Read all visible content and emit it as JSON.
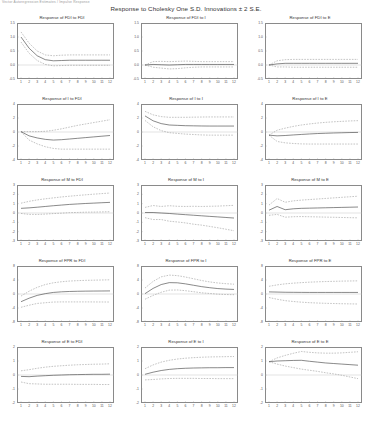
{
  "corner_note": "Vector Autoregression Estimates / Impulse Response",
  "main_title": "Response to Cholesky One S.D. Innovations ± 2 S.E.",
  "chart_data": {
    "type": "line",
    "title": "Response to Cholesky One S.D. Innovations ± 2 S.E.",
    "xlabel": "",
    "ylabel": "",
    "x": [
      1,
      2,
      3,
      4,
      5,
      6,
      7,
      8,
      9,
      10,
      11,
      12
    ],
    "grid": false,
    "legend": "none",
    "band_label": "± 2 S.E.",
    "response_variables": [
      "FDI",
      "I",
      "M",
      "FPR",
      "E"
    ],
    "shock_variables": [
      "FDI",
      "I",
      "E"
    ],
    "panels": [
      {
        "title": "Response of FDI to FDI",
        "response": "FDI",
        "shock": "FDI",
        "ylim": [
          -0.5,
          1.5
        ],
        "yticks": [
          "1.5",
          "1.0",
          "0.5",
          "0.0",
          "-0.5"
        ],
        "xticks": [
          "1",
          "2",
          "3",
          "4",
          "5",
          "6",
          "7",
          "8",
          "9",
          "10",
          "11",
          "12"
        ],
        "mean": [
          1.0,
          0.6,
          0.33,
          0.19,
          0.15,
          0.16,
          0.17,
          0.17,
          0.17,
          0.17,
          0.17,
          0.17
        ],
        "upper": [
          1.18,
          0.78,
          0.5,
          0.36,
          0.33,
          0.35,
          0.36,
          0.36,
          0.36,
          0.36,
          0.36,
          0.36
        ],
        "lower": [
          0.82,
          0.42,
          0.16,
          0.02,
          -0.03,
          -0.02,
          -0.01,
          -0.01,
          -0.01,
          -0.01,
          -0.01,
          -0.01
        ]
      },
      {
        "title": "Response of FDI to I",
        "response": "FDI",
        "shock": "I",
        "ylim": [
          -0.5,
          1.5
        ],
        "yticks": [
          "1.5",
          "1.0",
          "0.5",
          "0.0",
          "-0.5"
        ],
        "xticks": [
          "1",
          "2",
          "3",
          "4",
          "5",
          "6",
          "7",
          "8",
          "9",
          "10",
          "11",
          "12"
        ],
        "mean": [
          0.0,
          0.02,
          0.01,
          0.0,
          0.01,
          0.02,
          0.02,
          0.02,
          0.02,
          0.02,
          0.02,
          0.02
        ],
        "upper": [
          0.0,
          0.12,
          0.13,
          0.12,
          0.13,
          0.14,
          0.13,
          0.12,
          0.12,
          0.12,
          0.12,
          0.12
        ],
        "lower": [
          0.0,
          -0.08,
          -0.11,
          -0.14,
          -0.13,
          -0.1,
          -0.08,
          -0.07,
          -0.07,
          -0.07,
          -0.07,
          -0.07
        ]
      },
      {
        "title": "Response of FDI to E",
        "response": "FDI",
        "shock": "E",
        "ylim": [
          -0.5,
          1.5
        ],
        "yticks": [
          "1.5",
          "1.0",
          "0.5",
          "0.0",
          "-0.5"
        ],
        "xticks": [
          "1",
          "2",
          "3",
          "4",
          "5",
          "6",
          "7",
          "8",
          "9",
          "10",
          "11",
          "12"
        ],
        "mean": [
          0.0,
          0.04,
          0.06,
          0.06,
          0.06,
          0.06,
          0.06,
          0.06,
          0.06,
          0.06,
          0.06,
          0.06
        ],
        "upper": [
          0.0,
          0.15,
          0.19,
          0.2,
          0.2,
          0.2,
          0.2,
          0.2,
          0.2,
          0.2,
          0.2,
          0.2
        ],
        "lower": [
          0.0,
          -0.07,
          -0.07,
          -0.08,
          -0.08,
          -0.08,
          -0.08,
          -0.08,
          -0.08,
          -0.08,
          -0.08,
          -0.08
        ]
      },
      {
        "title": "Response of I to FDI",
        "response": "I",
        "shock": "FDI",
        "ylim": [
          -4,
          4
        ],
        "yticks": [
          "4",
          "2",
          "0",
          "-2",
          "-4"
        ],
        "xticks": [
          "1",
          "2",
          "3",
          "4",
          "5",
          "6",
          "7",
          "8",
          "9",
          "10",
          "11",
          "12"
        ],
        "mean": [
          0.05,
          -0.55,
          -0.85,
          -1.05,
          -1.15,
          -1.1,
          -1.0,
          -0.9,
          -0.8,
          -0.7,
          -0.6,
          -0.5
        ],
        "upper": [
          0.05,
          0.05,
          0.05,
          0.1,
          0.25,
          0.45,
          0.7,
          0.95,
          1.15,
          1.35,
          1.55,
          1.75
        ],
        "lower": [
          0.05,
          -1.15,
          -1.7,
          -2.1,
          -2.35,
          -2.45,
          -2.45,
          -2.45,
          -2.45,
          -2.45,
          -2.45,
          -2.45
        ]
      },
      {
        "title": "Response of I to I",
        "response": "I",
        "shock": "I",
        "ylim": [
          -4,
          4
        ],
        "yticks": [
          "4",
          "2",
          "0",
          "-2",
          "-4"
        ],
        "xticks": [
          "1",
          "2",
          "3",
          "4",
          "5",
          "6",
          "7",
          "8",
          "9",
          "10",
          "11",
          "12"
        ],
        "mean": [
          2.3,
          1.6,
          1.2,
          1.0,
          0.95,
          0.9,
          0.88,
          0.86,
          0.85,
          0.85,
          0.85,
          0.85
        ],
        "upper": [
          2.95,
          2.45,
          2.2,
          2.1,
          2.1,
          2.1,
          2.12,
          2.14,
          2.15,
          2.15,
          2.15,
          2.15
        ],
        "lower": [
          1.65,
          0.75,
          0.2,
          -0.1,
          -0.2,
          -0.3,
          -0.36,
          -0.42,
          -0.45,
          -0.45,
          -0.45,
          -0.45
        ]
      },
      {
        "title": "Response of I to E",
        "response": "I",
        "shock": "E",
        "ylim": [
          -4,
          4
        ],
        "yticks": [
          "4",
          "2",
          "0",
          "-2",
          "-4"
        ],
        "xticks": [
          "1",
          "2",
          "3",
          "4",
          "5",
          "6",
          "7",
          "8",
          "9",
          "10",
          "11",
          "12"
        ],
        "mean": [
          -0.45,
          -0.55,
          -0.5,
          -0.42,
          -0.35,
          -0.28,
          -0.22,
          -0.18,
          -0.14,
          -0.11,
          -0.08,
          -0.06
        ],
        "upper": [
          -0.45,
          0.25,
          0.55,
          0.8,
          1.0,
          1.15,
          1.28,
          1.38,
          1.46,
          1.52,
          1.58,
          1.62
        ],
        "lower": [
          -0.45,
          -1.35,
          -1.55,
          -1.64,
          -1.7,
          -1.72,
          -1.72,
          -1.72,
          -1.72,
          -1.72,
          -1.72,
          -1.72
        ]
      },
      {
        "title": "Response of M to FDI",
        "response": "M",
        "shock": "FDI",
        "ylim": [
          -3,
          3
        ],
        "yticks": [
          "3",
          "2",
          "1",
          "0",
          "-1",
          "-2",
          "-3"
        ],
        "xticks": [
          "1",
          "2",
          "3",
          "4",
          "5",
          "6",
          "7",
          "8",
          "9",
          "10",
          "11",
          "12"
        ],
        "mean": [
          0.5,
          0.55,
          0.62,
          0.7,
          0.78,
          0.85,
          0.92,
          0.97,
          1.02,
          1.06,
          1.1,
          1.14
        ],
        "upper": [
          1.05,
          1.25,
          1.4,
          1.52,
          1.62,
          1.72,
          1.8,
          1.88,
          1.95,
          2.02,
          2.08,
          2.14
        ],
        "lower": [
          -0.05,
          -0.15,
          -0.16,
          -0.12,
          -0.06,
          -0.02,
          0.04,
          0.06,
          0.09,
          0.1,
          0.12,
          0.14
        ]
      },
      {
        "title": "Response of M to I",
        "response": "M",
        "shock": "I",
        "ylim": [
          -3,
          3
        ],
        "yticks": [
          "3",
          "2",
          "1",
          "0",
          "-1",
          "-2",
          "-3"
        ],
        "xticks": [
          "1",
          "2",
          "3",
          "4",
          "5",
          "6",
          "7",
          "8",
          "9",
          "10",
          "11",
          "12"
        ],
        "mean": [
          0.05,
          0.05,
          0.0,
          -0.05,
          -0.12,
          -0.18,
          -0.24,
          -0.3,
          -0.36,
          -0.42,
          -0.48,
          -0.54
        ],
        "upper": [
          0.6,
          0.8,
          0.7,
          0.78,
          0.72,
          0.7,
          0.72,
          0.7,
          0.72,
          0.74,
          0.78,
          0.82
        ],
        "lower": [
          -0.5,
          -0.7,
          -0.7,
          -0.88,
          -0.96,
          -1.06,
          -1.2,
          -1.3,
          -1.44,
          -1.58,
          -1.74,
          -1.9
        ]
      },
      {
        "title": "Response of M to E",
        "response": "M",
        "shock": "E",
        "ylim": [
          -3,
          3
        ],
        "yticks": [
          "3",
          "2",
          "1",
          "0",
          "-1",
          "-2",
          "-3"
        ],
        "xticks": [
          "1",
          "2",
          "3",
          "4",
          "5",
          "6",
          "7",
          "8",
          "9",
          "10",
          "11",
          "12"
        ],
        "mean": [
          0.3,
          0.7,
          0.35,
          0.45,
          0.5,
          0.52,
          0.54,
          0.56,
          0.58,
          0.6,
          0.62,
          0.64
        ],
        "upper": [
          0.85,
          1.55,
          1.15,
          1.3,
          1.38,
          1.44,
          1.5,
          1.56,
          1.62,
          1.68,
          1.74,
          1.8
        ],
        "lower": [
          -0.25,
          -0.15,
          -0.45,
          -0.4,
          -0.38,
          -0.4,
          -0.42,
          -0.44,
          -0.46,
          -0.48,
          -0.5,
          -0.52
        ]
      },
      {
        "title": "Response of FPR to FDI",
        "response": "FPR",
        "shock": "FDI",
        "ylim": [
          -8,
          8
        ],
        "yticks": [
          "8",
          "4",
          "0",
          "-4",
          "-8"
        ],
        "xticks": [
          "1",
          "2",
          "3",
          "4",
          "5",
          "6",
          "7",
          "8",
          "9",
          "10",
          "11",
          "12"
        ],
        "mean": [
          -2.2,
          -1.2,
          -0.4,
          0.1,
          0.45,
          0.62,
          0.72,
          0.78,
          0.82,
          0.84,
          0.86,
          0.88
        ],
        "upper": [
          -0.6,
          0.8,
          1.9,
          2.7,
          3.2,
          3.5,
          3.7,
          3.82,
          3.9,
          3.95,
          4.0,
          4.05
        ],
        "lower": [
          -3.8,
          -3.2,
          -2.7,
          -2.5,
          -2.3,
          -2.26,
          -2.26,
          -2.26,
          -2.26,
          -2.27,
          -2.28,
          -2.29
        ]
      },
      {
        "title": "Response of FPR to I",
        "response": "FPR",
        "shock": "I",
        "ylim": [
          -8,
          8
        ],
        "yticks": [
          "8",
          "4",
          "0",
          "-4",
          "-8"
        ],
        "xticks": [
          "1",
          "2",
          "3",
          "4",
          "5",
          "6",
          "7",
          "8",
          "9",
          "10",
          "11",
          "12"
        ],
        "mean": [
          0.1,
          1.6,
          2.7,
          3.25,
          3.2,
          2.9,
          2.5,
          2.1,
          1.8,
          1.55,
          1.4,
          1.3
        ],
        "upper": [
          1.7,
          3.6,
          4.9,
          5.4,
          5.25,
          4.85,
          4.35,
          3.85,
          3.45,
          3.15,
          2.95,
          2.8
        ],
        "lower": [
          -1.5,
          -0.4,
          0.5,
          1.1,
          1.15,
          0.95,
          0.65,
          0.35,
          0.15,
          -0.05,
          -0.15,
          -0.2
        ]
      },
      {
        "title": "Response of FPR to E",
        "response": "FPR",
        "shock": "E",
        "ylim": [
          -8,
          8
        ],
        "yticks": [
          "8",
          "4",
          "0",
          "-4",
          "-8"
        ],
        "xticks": [
          "1",
          "2",
          "3",
          "4",
          "5",
          "6",
          "7",
          "8",
          "9",
          "10",
          "11",
          "12"
        ],
        "mean": [
          0.6,
          0.55,
          0.5,
          0.48,
          0.46,
          0.45,
          0.45,
          0.45,
          0.45,
          0.45,
          0.45,
          0.45
        ],
        "upper": [
          2.2,
          2.6,
          2.9,
          3.1,
          3.25,
          3.38,
          3.48,
          3.56,
          3.62,
          3.68,
          3.72,
          3.76
        ],
        "lower": [
          -1.0,
          -1.5,
          -1.9,
          -2.14,
          -2.33,
          -2.48,
          -2.58,
          -2.66,
          -2.72,
          -2.78,
          -2.82,
          -2.86
        ]
      },
      {
        "title": "Response of E to FDI",
        "response": "E",
        "shock": "FDI",
        "ylim": [
          -2,
          2
        ],
        "yticks": [
          "2",
          "1",
          "0",
          "-1",
          "-2"
        ],
        "xticks": [
          "1",
          "2",
          "3",
          "4",
          "5",
          "6",
          "7",
          "8",
          "9",
          "10",
          "11",
          "12"
        ],
        "mean": [
          -0.1,
          -0.12,
          -0.08,
          -0.05,
          -0.02,
          0.0,
          0.02,
          0.03,
          0.04,
          0.05,
          0.05,
          0.06
        ],
        "upper": [
          0.3,
          0.38,
          0.48,
          0.56,
          0.62,
          0.66,
          0.7,
          0.73,
          0.75,
          0.77,
          0.78,
          0.8
        ],
        "lower": [
          -0.5,
          -0.62,
          -0.64,
          -0.66,
          -0.66,
          -0.66,
          -0.66,
          -0.67,
          -0.67,
          -0.67,
          -0.68,
          -0.68
        ]
      },
      {
        "title": "Response of E to I",
        "response": "E",
        "shock": "I",
        "ylim": [
          -2,
          2
        ],
        "yticks": [
          "2",
          "1",
          "0",
          "-1",
          "-2"
        ],
        "xticks": [
          "1",
          "2",
          "3",
          "4",
          "5",
          "6",
          "7",
          "8",
          "9",
          "10",
          "11",
          "12"
        ],
        "mean": [
          0.05,
          0.2,
          0.32,
          0.4,
          0.45,
          0.48,
          0.5,
          0.51,
          0.52,
          0.52,
          0.53,
          0.53
        ],
        "upper": [
          0.45,
          0.72,
          0.92,
          1.05,
          1.14,
          1.2,
          1.24,
          1.27,
          1.29,
          1.3,
          1.31,
          1.32
        ],
        "lower": [
          -0.35,
          -0.32,
          -0.28,
          -0.25,
          -0.24,
          -0.24,
          -0.24,
          -0.25,
          -0.25,
          -0.26,
          -0.26,
          -0.26
        ]
      },
      {
        "title": "Response of E to E",
        "response": "E",
        "shock": "E",
        "ylim": [
          -2,
          2
        ],
        "yticks": [
          "2",
          "1",
          "0",
          "-1",
          "-2"
        ],
        "xticks": [
          "1",
          "2",
          "3",
          "4",
          "5",
          "6",
          "7",
          "8",
          "9",
          "10",
          "11",
          "12"
        ],
        "mean": [
          0.95,
          1.0,
          1.02,
          1.04,
          1.05,
          0.98,
          0.92,
          0.86,
          0.82,
          0.78,
          0.74,
          0.7
        ],
        "upper": [
          0.95,
          1.22,
          1.4,
          1.55,
          1.68,
          1.62,
          1.58,
          1.56,
          1.56,
          1.58,
          1.62,
          1.66
        ],
        "lower": [
          0.95,
          0.78,
          0.64,
          0.53,
          0.42,
          0.34,
          0.26,
          0.16,
          0.08,
          -0.02,
          -0.14,
          -0.26
        ]
      }
    ]
  }
}
